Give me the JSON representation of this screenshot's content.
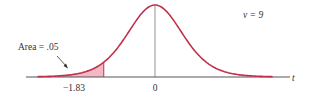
{
  "chart_data": {
    "type": "area",
    "title": "",
    "distribution": "Student's t",
    "degrees_of_freedom_label": "ν = 9",
    "degrees_of_freedom": 9,
    "xlabel": "t",
    "ylabel": "",
    "x_ticks": [
      {
        "value": -1.83,
        "label": "−1.83"
      },
      {
        "value": 0,
        "label": "0"
      }
    ],
    "shaded_region": {
      "from": "-inf",
      "to": -1.83,
      "area": 0.05
    },
    "annotation": "Area = .05",
    "xlim": [
      -4.2,
      4.2
    ],
    "grid": false,
    "legend": null
  },
  "labels": {
    "area": "Area = .05",
    "df": "ν = 9",
    "axis": "t",
    "tick_critical": "−1.83",
    "tick_zero": "0"
  },
  "colors": {
    "curve": "#c0304a",
    "shade": "#f2b8c4",
    "axis": "#333333",
    "text": "#333333"
  }
}
